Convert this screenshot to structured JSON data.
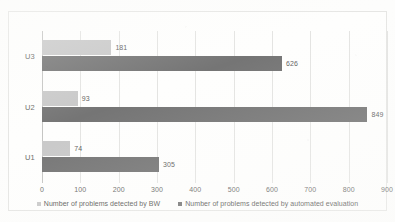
{
  "chart_data": {
    "type": "bar",
    "orientation": "horizontal",
    "title": "",
    "xlabel": "",
    "ylabel": "",
    "categories": [
      "U1",
      "U2",
      "U3"
    ],
    "display_order": [
      "U3",
      "U2",
      "U1"
    ],
    "series": [
      {
        "name": "Number of problems detected by BW",
        "color": "#c9c9c9",
        "values": [
          74,
          93,
          181
        ]
      },
      {
        "name": "Number of problems detected by automated evaluation",
        "color": "#757575",
        "values": [
          305,
          849,
          626
        ]
      }
    ],
    "xlim": [
      0,
      900
    ],
    "xticks": [
      0,
      100,
      200,
      300,
      400,
      500,
      600,
      700,
      800,
      900
    ],
    "xtick_labels": [
      "0",
      "100",
      "200",
      "300",
      "400",
      "500",
      "600",
      "700",
      "800",
      "900"
    ],
    "grid": true,
    "grid_axis": "x",
    "legend_position": "bottom",
    "data_labels": {
      "U3": {
        "bw": "181",
        "automated": "626"
      },
      "U2": {
        "bw": "93",
        "automated": "849"
      },
      "U1": {
        "bw": "74",
        "automated": "305"
      }
    }
  },
  "rows": [
    {
      "category": "U3",
      "bars": [
        {
          "series": "bw",
          "value": 181,
          "label": "181"
        },
        {
          "series": "automated",
          "value": 626,
          "label": "626"
        }
      ]
    },
    {
      "category": "U2",
      "bars": [
        {
          "series": "bw",
          "value": 93,
          "label": "93"
        },
        {
          "series": "automated",
          "value": 849,
          "label": "849"
        }
      ]
    },
    {
      "category": "U1",
      "bars": [
        {
          "series": "bw",
          "value": 74,
          "label": "74"
        },
        {
          "series": "automated",
          "value": 305,
          "label": "305"
        }
      ]
    }
  ],
  "legend": {
    "items": [
      {
        "label": "Number of problems detected by BW",
        "color": "#c9c9c9"
      },
      {
        "label": "Number of problems detected by automated evaluation",
        "color": "#757575"
      }
    ]
  }
}
